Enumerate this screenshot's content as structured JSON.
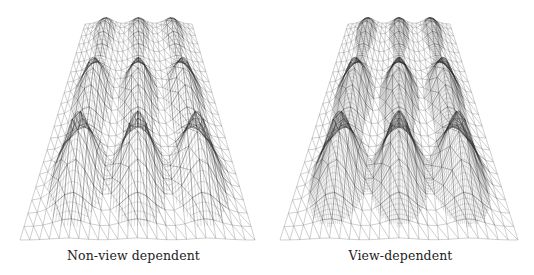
{
  "figure": {
    "panels": [
      {
        "id": "non-view-dependent",
        "caption": "Non-view dependent",
        "offset_x": 0,
        "mesh": {
          "top_left": [
            85,
            24
          ],
          "top_right": [
            192,
            24
          ],
          "bottom_left": [
            20,
            240
          ],
          "bottom_right": [
            255,
            240
          ],
          "density": "uniform",
          "peak_detail": 1.0
        }
      },
      {
        "id": "view-dependent",
        "caption": "View-dependent",
        "offset_x": 267,
        "mesh": {
          "top_left": [
            81,
            24
          ],
          "top_right": [
            183,
            24
          ],
          "bottom_left": [
            13,
            240
          ],
          "bottom_right": [
            251,
            240
          ],
          "density": "view-dependent",
          "peak_detail": 1.6
        }
      }
    ],
    "peaks": {
      "rows": 3,
      "cols": 3
    },
    "colors": {
      "mesh_line": "#8a8a8a",
      "peak_line": "#2a2a2a",
      "caption": "#222222",
      "background": "#ffffff"
    }
  }
}
